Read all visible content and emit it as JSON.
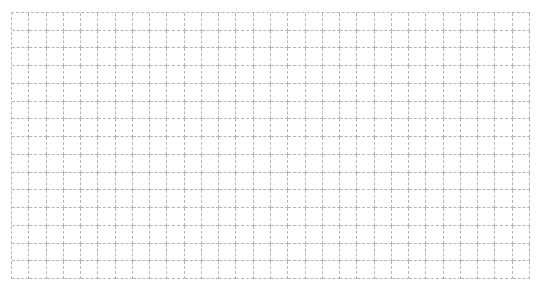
{
  "grid": {
    "columns": 30,
    "rows": 15,
    "line_color": "#b5b5b5",
    "line_style": "dashed",
    "background": "#ffffff"
  }
}
